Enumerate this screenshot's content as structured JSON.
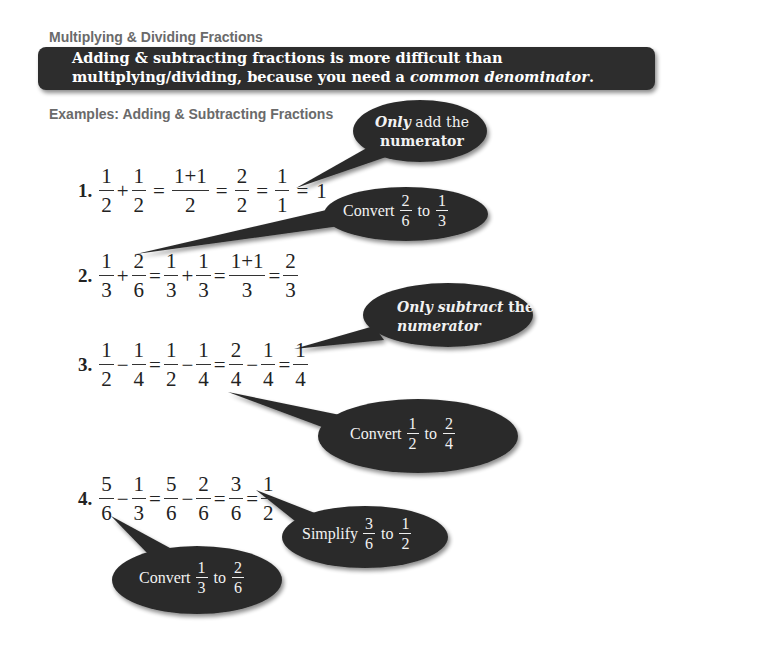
{
  "page": {
    "section_heading": "Multiplying & Dividing Fractions",
    "banner": {
      "line1": "Adding & subtracting fractions is more difficult than",
      "line2_prefix": "multiplying/dividing, because you need a ",
      "line2_emphasis": "common denominator",
      "line2_suffix": "."
    },
    "examples_heading": "Examples:  Adding & Subtracting Fractions"
  },
  "colors": {
    "banner_bg": "#2d2d2d",
    "callout_bg": "#2b2b2b",
    "heading_gray": "#6a6a6a",
    "callout_text": "#f2f2f2"
  },
  "examples": [
    {
      "label": "1.",
      "tokens": [
        {
          "type": "frac",
          "n": "1",
          "d": "2"
        },
        {
          "type": "op",
          "v": "+"
        },
        {
          "type": "frac",
          "n": "1",
          "d": "2"
        },
        {
          "type": "op",
          "v": "="
        },
        {
          "type": "frac",
          "n": "1+1",
          "d": "2"
        },
        {
          "type": "op",
          "v": "="
        },
        {
          "type": "frac",
          "n": "2",
          "d": "2"
        },
        {
          "type": "op",
          "v": "="
        },
        {
          "type": "frac",
          "n": "1",
          "d": "1"
        },
        {
          "type": "op",
          "v": "="
        },
        {
          "type": "text",
          "v": "1"
        }
      ]
    },
    {
      "label": "2.",
      "tokens": [
        {
          "type": "frac",
          "n": "1",
          "d": "3"
        },
        {
          "type": "op",
          "v": "+"
        },
        {
          "type": "frac",
          "n": "2",
          "d": "6"
        },
        {
          "type": "op",
          "v": "="
        },
        {
          "type": "frac",
          "n": "1",
          "d": "3"
        },
        {
          "type": "op",
          "v": "+"
        },
        {
          "type": "frac",
          "n": "1",
          "d": "3"
        },
        {
          "type": "op",
          "v": "="
        },
        {
          "type": "frac",
          "n": "1+1",
          "d": "3"
        },
        {
          "type": "op",
          "v": "="
        },
        {
          "type": "frac",
          "n": "2",
          "d": "3"
        }
      ]
    },
    {
      "label": "3.",
      "tokens": [
        {
          "type": "frac",
          "n": "1",
          "d": "2"
        },
        {
          "type": "op",
          "v": "−"
        },
        {
          "type": "frac",
          "n": "1",
          "d": "4"
        },
        {
          "type": "op",
          "v": "="
        },
        {
          "type": "frac",
          "n": "1",
          "d": "2"
        },
        {
          "type": "op",
          "v": "−"
        },
        {
          "type": "frac",
          "n": "1",
          "d": "4"
        },
        {
          "type": "op",
          "v": "="
        },
        {
          "type": "frac",
          "n": "2",
          "d": "4"
        },
        {
          "type": "op",
          "v": "−"
        },
        {
          "type": "frac",
          "n": "1",
          "d": "4"
        },
        {
          "type": "op",
          "v": "="
        },
        {
          "type": "frac",
          "n": "1",
          "d": "4"
        }
      ]
    },
    {
      "label": "4.",
      "tokens": [
        {
          "type": "frac",
          "n": "5",
          "d": "6"
        },
        {
          "type": "op",
          "v": "−"
        },
        {
          "type": "frac",
          "n": "1",
          "d": "3"
        },
        {
          "type": "op",
          "v": "="
        },
        {
          "type": "frac",
          "n": "5",
          "d": "6"
        },
        {
          "type": "op",
          "v": "−"
        },
        {
          "type": "frac",
          "n": "2",
          "d": "6"
        },
        {
          "type": "op",
          "v": "="
        },
        {
          "type": "frac",
          "n": "3",
          "d": "6"
        },
        {
          "type": "op",
          "v": "="
        },
        {
          "type": "frac",
          "n": "1",
          "d": "2"
        }
      ]
    }
  ],
  "callouts": {
    "only_add": {
      "emph": "Only",
      "rest": " add the",
      "line2": "numerator"
    },
    "convert_2_6": {
      "word1": "Convert",
      "from": {
        "n": "2",
        "d": "6"
      },
      "word2": "to",
      "to": {
        "n": "1",
        "d": "3"
      }
    },
    "only_subtract": {
      "emph": "Only subtract",
      "rest": " the",
      "line2": "numerator"
    },
    "convert_1_2": {
      "word1": "Convert",
      "from": {
        "n": "1",
        "d": "2"
      },
      "word2": "to",
      "to": {
        "n": "2",
        "d": "4"
      }
    },
    "simplify_3_6": {
      "word1": "Simplify",
      "from": {
        "n": "3",
        "d": "6"
      },
      "word2": "to",
      "to": {
        "n": "1",
        "d": "2"
      }
    },
    "convert_1_3": {
      "word1": "Convert",
      "from": {
        "n": "1",
        "d": "3"
      },
      "word2": "to",
      "to": {
        "n": "2",
        "d": "6"
      }
    }
  }
}
